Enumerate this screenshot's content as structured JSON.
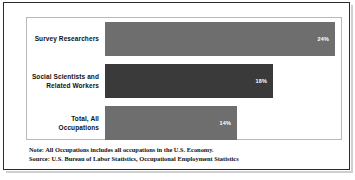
{
  "figure": {
    "background_color": "#ffffff",
    "frame_color": "#2b2b2b",
    "plot_border_color": "#b9b9b9"
  },
  "chart_data": {
    "type": "bar",
    "orientation": "horizontal",
    "title": "",
    "subtitle": "",
    "xlabel": "",
    "ylabel": "",
    "categories": [
      "Survey Researchers",
      "Social Scientists and Related Workers",
      "Total, All Occupations"
    ],
    "values": [
      24,
      18,
      14
    ],
    "value_labels": [
      "24%",
      "18%",
      "14%"
    ],
    "bar_colors": [
      "#6e6e6e",
      "#3a3a3a",
      "#6e6e6e"
    ],
    "xlim": [
      0,
      24
    ],
    "grid": false,
    "legend": null,
    "annotations": [
      "Note: All Occupations includes all occupations in the U.S. Economy.",
      "Source: U.S. Bureau of Labor Statistics, Occupational Employment Statistics"
    ]
  },
  "categories": [
    {
      "label_line1": "Survey Researchers",
      "label_line2": "",
      "value_label": "24%",
      "bar_color": "#6e6e6e",
      "bar_width_px": 230
    },
    {
      "label_line1": "Social Scientists and",
      "label_line2": "Related Workers",
      "value_label": "18%",
      "bar_color": "#3a3a3a",
      "bar_width_px": 168
    },
    {
      "label_line1": "Total, All",
      "label_line2": "Occupations",
      "value_label": "14%",
      "bar_color": "#6e6e6e",
      "bar_width_px": 132
    }
  ],
  "footnotes": {
    "note": "Note: All Occupations includes all occupations in the U.S. Economy.",
    "source": "Source: U.S. Bureau of Labor Statistics, Occupational Employment Statistics"
  }
}
